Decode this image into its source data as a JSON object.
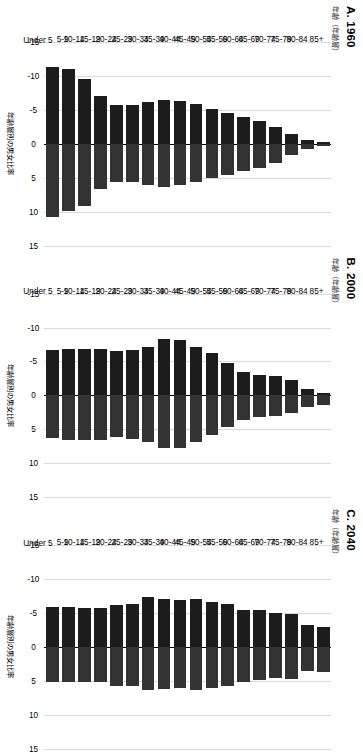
{
  "figure": {
    "axis_x_title": "年齢層別の男女比率",
    "axis_y_title": "年齢（年齢層）",
    "legend": [
      {
        "label": "男性",
        "color": "#333333"
      },
      {
        "label": "女性",
        "color": "#1c1c1c"
      }
    ],
    "tick_labels": [
      "-15",
      "-10",
      "-5",
      "0",
      "5",
      "10",
      "15"
    ],
    "tick_values": [
      -15,
      -10,
      -5,
      0,
      5,
      10,
      15
    ],
    "categories": [
      "85+",
      "80-84",
      "75-79",
      "70-74",
      "65-69",
      "60-64",
      "55-59",
      "50-54",
      "45-49",
      "40-44",
      "35-39",
      "30-34",
      "25-29",
      "20-24",
      "15-19",
      "10-14",
      "5-9",
      "Under 5"
    ],
    "panels": [
      {
        "title": "A. 1960"
      },
      {
        "title": "B. 2000"
      },
      {
        "title": "C. 2040"
      }
    ]
  },
  "chart_data": [
    {
      "type": "bar",
      "title": "A. 1960",
      "xlabel": "年齢層別の男女比率",
      "ylabel": "年齢（年齢層）",
      "xlim": [
        -15,
        15
      ],
      "grid": true,
      "legend_position": "bottom",
      "categories": [
        "85+",
        "80-84",
        "75-79",
        "70-74",
        "65-69",
        "60-64",
        "55-59",
        "50-54",
        "45-49",
        "40-44",
        "35-39",
        "30-34",
        "25-29",
        "20-24",
        "15-19",
        "10-14",
        "5-9",
        "Under 5"
      ],
      "series": [
        {
          "name": "男性",
          "values": [
            0.3,
            0.8,
            1.7,
            2.8,
            3.6,
            4.0,
            4.6,
            5.0,
            5.7,
            6.0,
            6.3,
            6.0,
            5.6,
            5.6,
            6.6,
            9.2,
            9.9,
            10.8
          ]
        },
        {
          "name": "女性",
          "values": [
            -0.3,
            -0.5,
            -1.5,
            -2.5,
            -3.4,
            -3.9,
            -4.5,
            -5.1,
            -5.8,
            -6.3,
            -6.5,
            -6.2,
            -5.7,
            -5.7,
            -7.1,
            -9.6,
            -11.0,
            -11.3
          ]
        }
      ]
    },
    {
      "type": "bar",
      "title": "B. 2000",
      "xlabel": "年齢層別の男女比率",
      "ylabel": "年齢（年齢層）",
      "xlim": [
        -15,
        15
      ],
      "grid": true,
      "legend_position": "bottom",
      "categories": [
        "85+",
        "80-84",
        "75-79",
        "70-74",
        "65-69",
        "60-64",
        "55-59",
        "50-54",
        "45-49",
        "40-44",
        "35-39",
        "30-34",
        "25-29",
        "20-24",
        "15-19",
        "10-14",
        "5-9",
        "Under 5"
      ],
      "series": [
        {
          "name": "男性",
          "values": [
            1.4,
            1.7,
            2.6,
            3.1,
            3.2,
            3.6,
            4.6,
            5.9,
            6.8,
            7.7,
            7.8,
            6.9,
            6.4,
            6.2,
            6.5,
            6.6,
            6.6,
            6.3
          ]
        },
        {
          "name": "女性",
          "values": [
            -0.4,
            -1.0,
            -2.2,
            -2.9,
            -3.0,
            -3.5,
            -4.7,
            -6.2,
            -7.2,
            -8.2,
            -8.3,
            -7.2,
            -6.7,
            -6.6,
            -6.8,
            -6.9,
            -6.9,
            -6.7
          ]
        }
      ]
    },
    {
      "type": "bar",
      "title": "C. 2040",
      "xlabel": "年齢層別の男女比率",
      "ylabel": "年齢（年齢層）",
      "xlim": [
        -15,
        15
      ],
      "grid": true,
      "legend_position": "bottom",
      "categories": [
        "85+",
        "80-84",
        "75-79",
        "70-74",
        "65-69",
        "60-64",
        "55-59",
        "50-54",
        "45-49",
        "40-44",
        "35-39",
        "30-34",
        "25-29",
        "20-24",
        "15-19",
        "10-14",
        "5-9",
        "Under 5"
      ],
      "series": [
        {
          "name": "男性",
          "values": [
            3.7,
            3.5,
            4.7,
            4.6,
            4.8,
            5.1,
            5.8,
            6.0,
            6.4,
            6.1,
            6.2,
            6.4,
            5.8,
            5.7,
            5.1,
            5.1,
            5.2,
            5.2
          ]
        },
        {
          "name": "女性",
          "values": [
            -2.9,
            -3.3,
            -4.9,
            -5.0,
            -5.4,
            -5.5,
            -6.4,
            -6.6,
            -7.0,
            -6.9,
            -7.0,
            -7.4,
            -6.3,
            -6.2,
            -5.8,
            -5.8,
            -5.9,
            -5.9
          ]
        }
      ]
    }
  ]
}
